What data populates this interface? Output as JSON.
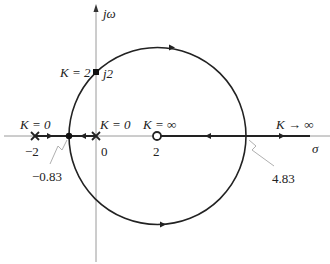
{
  "diagram": {
    "type": "root-locus",
    "axes": {
      "imag_label": "jω",
      "real_label": "σ"
    },
    "poles": [
      {
        "value": "-2",
        "label": "K = 0"
      },
      {
        "value": "0",
        "label": "K = 0"
      }
    ],
    "zeros": [
      {
        "value": "2",
        "label": "K = ∞"
      }
    ],
    "points": {
      "breakaway": "−0.83",
      "break_in": "4.83",
      "imag_crossing": {
        "value": "j2",
        "label": "K = 2"
      }
    },
    "asymptote_label": "K → ∞",
    "tick_labels": {
      "minus_two": "−2",
      "zero": "0",
      "two": "2"
    },
    "colors": {
      "curve": "#222222",
      "axis": "#9a9a9a",
      "leader": "#b0b0b0"
    }
  }
}
